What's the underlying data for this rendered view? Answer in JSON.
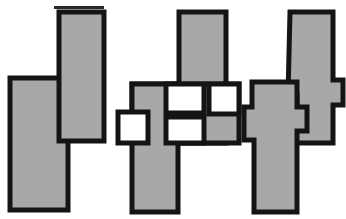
{
  "figure": {
    "title_fragment": "geometric interlocking shapes",
    "canvas": {
      "width": 346,
      "height": 219
    },
    "colors": {
      "background": "#ffffff",
      "fill_grey": "#a8a8a8",
      "outline_black": "#141414",
      "hole_white": "#ffffff",
      "text_grey": "#4a4a4a"
    },
    "stroke_width": 5,
    "top_sliver": {
      "text": "                     ",
      "visible": true
    },
    "groups": [
      {
        "id": "group-1",
        "name": "overlapping-pair",
        "label": "Group 1 - two offset rectangles",
        "shape_count": 2,
        "hole_count": 0,
        "shapes": [
          {
            "id": "g1-left-bar",
            "name": "left-vertical-bar",
            "type": "rectangle",
            "points": "10,78 68,78 68,210 10,210"
          },
          {
            "id": "g1-right-bar",
            "name": "right-vertical-bar",
            "type": "rectangle",
            "points": "59,12 104,12 104,141 59,141"
          }
        ]
      },
      {
        "id": "group-2",
        "name": "cross-with-holes",
        "label": "Group 2 - crossing bars with four square holes",
        "shape_count": 3,
        "hole_count": 4,
        "shapes": [
          {
            "id": "g2-horizontal-bar",
            "name": "horizontal-cross-bar",
            "type": "rectangle",
            "points": "132,84 239,84 239,143 132,143"
          },
          {
            "id": "g2-vertical-bar",
            "name": "vertical-cross-bar",
            "type": "rectangle",
            "points": "132,84 178,84 178,212 132,212"
          },
          {
            "id": "g2-tall-column",
            "name": "tall-right-column",
            "type": "rectangle",
            "points": "179,12 226,12 226,143 179,143"
          }
        ],
        "holes": [
          {
            "id": "g2-hole-left",
            "name": "square-hole-left",
            "points": "118,112 148,112 148,143 118,143"
          },
          {
            "id": "g2-hole-mid-top",
            "name": "square-hole-middle-top",
            "points": "166,84 204,84 204,113 166,113"
          },
          {
            "id": "g2-hole-mid-bottom",
            "name": "square-hole-middle-bottom",
            "points": "166,117 204,117 204,143 166,143"
          },
          {
            "id": "g2-hole-right",
            "name": "square-hole-right",
            "points": "209,84 239,84 239,114 209,114"
          }
        ]
      },
      {
        "id": "group-3",
        "name": "interlocking-puzzle-pair",
        "label": "Group 3 - two interlocking tabbed pieces",
        "shape_count": 2,
        "hole_count": 0,
        "shapes": [
          {
            "id": "g3-front-piece",
            "name": "front-tabbed-piece",
            "type": "polygon",
            "points": "252,82 297,82 297,107 307,107 307,131 297,131 297,212 254,212 254,140 244,140 244,107 252,107"
          },
          {
            "id": "g3-back-piece",
            "name": "back-tabbed-piece",
            "type": "polygon",
            "points": "290,12 333,12 333,80 343,80 343,105 333,105 333,143 288,143 288,117 297,117 297,95 288,95"
          }
        ]
      }
    ]
  }
}
